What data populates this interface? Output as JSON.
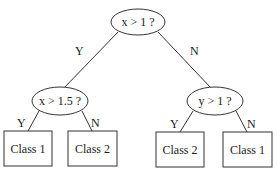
{
  "diagram": {
    "type": "decision-tree",
    "root": {
      "label": "x > 1 ?",
      "yes_label": "Y",
      "no_label": "N"
    },
    "left": {
      "label": "x > 1.5 ?",
      "yes_label": "Y",
      "no_label": "N",
      "yes_leaf": "Class 1",
      "no_leaf": "Class 2"
    },
    "right": {
      "label": "y > 1 ?",
      "yes_label": "Y",
      "no_label": "N",
      "yes_leaf": "Class 2",
      "no_leaf": "Class 1"
    }
  }
}
